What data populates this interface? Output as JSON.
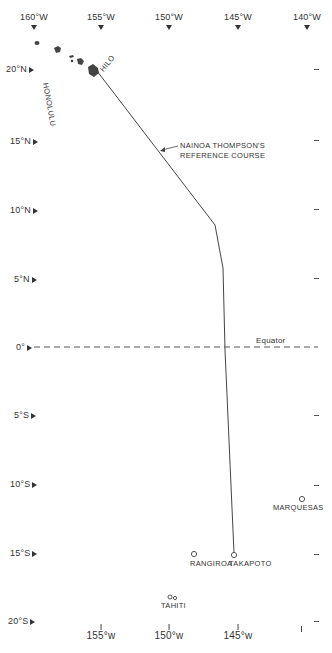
{
  "map": {
    "title": "",
    "longitude_labels_top": [
      "160°W",
      "155°W",
      "150°W",
      "145°W",
      "140°W"
    ],
    "longitude_labels_bottom": [
      "155°w",
      "150°w",
      "145°w"
    ],
    "latitude_labels": [
      "20°N",
      "15°N",
      "10°N",
      "5°N",
      "0°",
      "5°S",
      "10°S",
      "15°S",
      "20°S"
    ],
    "equator_label": "Equator",
    "course_annotation": {
      "line1": "NAINOA THOMPSON'S",
      "line2": "REFERENCE COURSE"
    },
    "places": [
      {
        "name": "HONOLULU"
      },
      {
        "name": "HILO"
      },
      {
        "name": "MARQUESAS"
      },
      {
        "name": "RANGIROA"
      },
      {
        "name": "TAKAPOTO"
      },
      {
        "name": "TAHITI"
      }
    ],
    "colors": {
      "ink": "#333333",
      "background": "#ffffff"
    }
  }
}
